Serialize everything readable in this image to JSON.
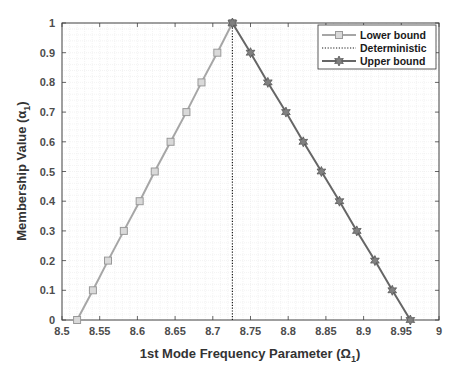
{
  "chart_data": {
    "type": "line",
    "title": "",
    "xlabel": "1st Mode Frequency Parameter (Ω1)",
    "ylabel": "Membership Value (α1)",
    "xlim": [
      8.5,
      9
    ],
    "ylim": [
      0,
      1
    ],
    "x_ticks": [
      "8.5",
      "8.55",
      "8.6",
      "8.65",
      "8.7",
      "8.75",
      "8.8",
      "8.85",
      "8.9",
      "8.95",
      "9"
    ],
    "y_ticks": [
      "0",
      "0.1",
      "0.2",
      "0.3",
      "0.4",
      "0.5",
      "0.6",
      "0.7",
      "0.8",
      "0.9",
      "1"
    ],
    "grid": "minor grid on",
    "legend_position": "upper right",
    "series": [
      {
        "name": "Lower bound",
        "color": "#a6a6a6",
        "marker": "square",
        "linestyle": "solid",
        "alpha": [
          0,
          0.1,
          0.2,
          0.3,
          0.4,
          0.5,
          0.6,
          0.7,
          0.8,
          0.9,
          1
        ],
        "x": [
          8.52,
          8.541,
          8.561,
          8.582,
          8.603,
          8.623,
          8.644,
          8.665,
          8.685,
          8.706,
          8.726
        ]
      },
      {
        "name": "Deterministic",
        "color": "#1a1a1a",
        "marker": "none",
        "linestyle": "dotted",
        "alpha": [
          0,
          1
        ],
        "x": [
          8.726,
          8.726
        ]
      },
      {
        "name": "Upper bound",
        "color": "#666666",
        "marker": "star",
        "linestyle": "solid",
        "alpha": [
          1,
          0.9,
          0.8,
          0.7,
          0.6,
          0.5,
          0.4,
          0.3,
          0.2,
          0.1,
          0
        ],
        "x": [
          8.726,
          8.75,
          8.773,
          8.797,
          8.82,
          8.844,
          8.868,
          8.891,
          8.915,
          8.938,
          8.962
        ]
      }
    ]
  },
  "labels": {
    "xlabel_main": "1st Mode Frequency Parameter (Ω",
    "xlabel_sub": "1",
    "xlabel_close": ")",
    "ylabel_main": "Membership Value (α",
    "ylabel_sub": "1",
    "ylabel_close": ")"
  },
  "legend": [
    "Lower bound",
    "Deterministic",
    "Upper bound"
  ]
}
